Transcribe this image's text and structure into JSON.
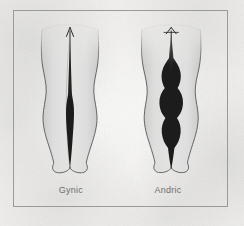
{
  "figure": {
    "kind": "anatomical-diagram",
    "background_color": "#f2f1ef",
    "border_color": "#9a9a99",
    "limb_fill_color": "#dcdcdc",
    "limb_outline_color": "#4a4a4a",
    "gap_color": "#1c1c1c",
    "arrow_color": "#2a2a2a",
    "label_color": "#6d6d6c"
  },
  "panels": [
    {
      "id": "gynic",
      "label": "Gynic",
      "gap_shape": "narrow single tapering spindle",
      "arrow": "up-arrow-icon"
    },
    {
      "id": "andric",
      "label": "Andric",
      "gap_shape": "wide multi-bulge column",
      "arrow": "up-arrow-icon"
    }
  ]
}
